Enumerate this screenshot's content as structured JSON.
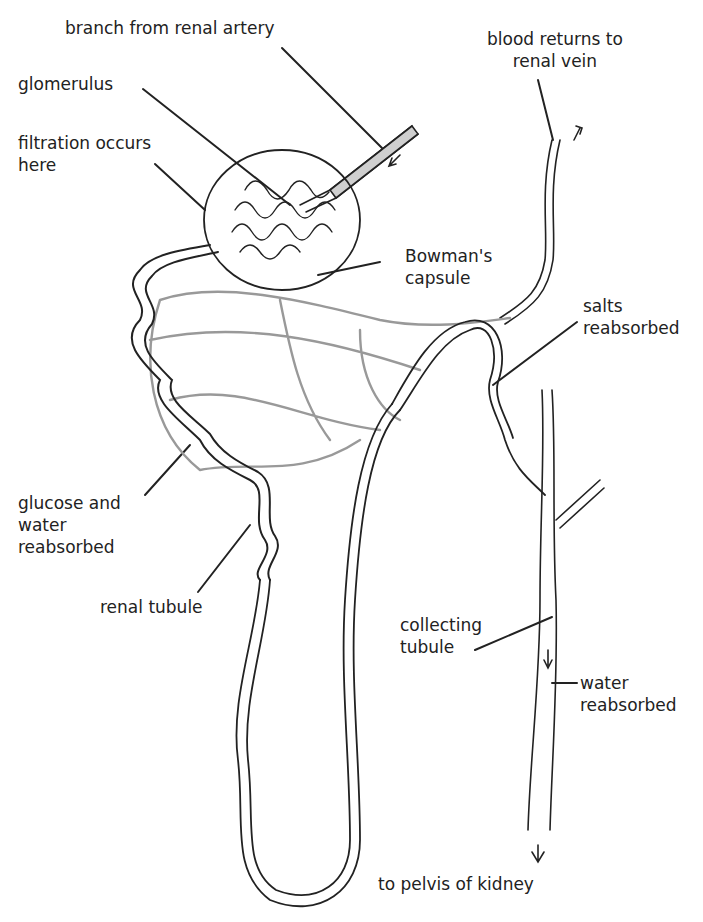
{
  "diagram": {
    "labels": {
      "renal_artery": "branch from renal artery",
      "glomerulus": "glomerulus",
      "filtration": "filtration occurs\nhere",
      "renal_vein": "blood returns to\nrenal vein",
      "bowmans_capsule": "Bowman's\ncapsule",
      "salts": "salts\nreabsorbed",
      "glucose_water": "glucose and\nwater\nreabsorbed",
      "renal_tubule": "renal tubule",
      "collecting_tubule": "collecting\ntubule",
      "water": "water\nreabsorbed",
      "pelvis": "to pelvis of kidney"
    },
    "colors": {
      "ink": "#222222",
      "vessel_fill": "#cfcfcf",
      "background": "#ffffff"
    }
  }
}
